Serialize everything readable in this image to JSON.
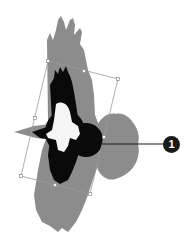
{
  "figure": {
    "colors": {
      "background": "#ffffff",
      "shadow_bird": "#8c8c8c",
      "bird_body": "#0a0a0a",
      "bird_highlight": "#f5f5f5",
      "bounding_box": "#9a9a9a",
      "callout": "#1a1a1a"
    },
    "bounding_box": {
      "corners": {
        "top_left": [
          48,
          61
        ],
        "top_right": [
          118,
          79
        ],
        "bottom_right": [
          90,
          194
        ],
        "bottom_left": [
          21,
          176
        ]
      },
      "handles": {
        "top_mid": [
          84,
          71
        ],
        "right_mid": [
          104,
          137
        ],
        "bottom_mid": [
          55,
          185
        ],
        "left_mid": [
          35,
          118
        ]
      }
    },
    "callout": {
      "label": "1",
      "line_start": [
        102,
        144
      ],
      "line_end": [
        163,
        144
      ]
    }
  }
}
